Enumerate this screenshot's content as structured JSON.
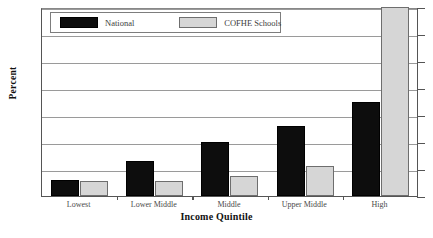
{
  "chart_data": {
    "type": "bar",
    "title": "",
    "xlabel": "Income Quintile",
    "ylabel": "Percent",
    "ylim": [
      0,
      70
    ],
    "yticks": [
      0,
      10,
      20,
      30,
      40,
      50,
      60,
      70
    ],
    "grid": true,
    "legend_position": "top-left",
    "categories": [
      "Lowest",
      "Lower Middle",
      "Middle",
      "Upper Middle",
      "High"
    ],
    "series": [
      {
        "name": "National",
        "color": "#0d0d0d",
        "values": [
          6,
          13,
          20,
          26,
          35
        ]
      },
      {
        "name": "COFHE Schools",
        "color": "#d6d6d6",
        "values": [
          5.5,
          5.5,
          7.5,
          11,
          70
        ]
      }
    ]
  },
  "legend": {
    "entries": [
      {
        "label": "National",
        "swatch": "black-swatch"
      },
      {
        "label": "COFHE Schools",
        "swatch": "gray-swatch"
      }
    ]
  },
  "axes": {
    "y_title": "Percent",
    "x_title": "Income Quintile",
    "y_tick_labels": [
      "70",
      "60",
      "50",
      "40",
      "30",
      "20",
      "10"
    ],
    "x_tick_labels": [
      "Lowest",
      "Lower Middle",
      "Middle",
      "Upper Middle",
      "High"
    ]
  }
}
